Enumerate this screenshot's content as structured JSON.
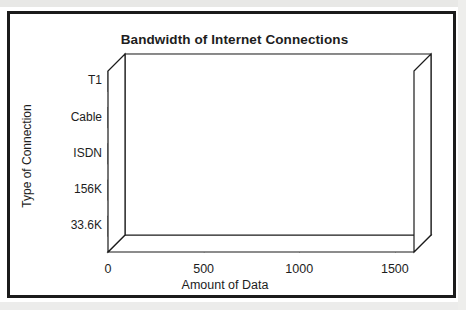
{
  "chart_data": {
    "type": "bar",
    "orientation": "horizontal",
    "style": "3d",
    "title": "Bandwidth of Internet Connections",
    "xlabel": "Amount of Data",
    "ylabel": "Type of Connection",
    "categories": [
      "T1",
      "Cable",
      "ISDN",
      "156K",
      "33.6K"
    ],
    "values": [
      1390,
      1045,
      640,
      255,
      145
    ],
    "xticks": [
      "0",
      "500",
      "1000",
      "1500"
    ],
    "xtickvalues": [
      0,
      500,
      1000,
      1500
    ],
    "xlim": [
      0,
      1600
    ],
    "grid": "vertical",
    "legend": "none",
    "series": [
      {
        "name": "Bandwidth",
        "values": [
          1390,
          1045,
          640,
          255,
          145
        ]
      }
    ],
    "colors": {
      "bar_front": "#a9a9a9",
      "bar_top": "#bdbdbd",
      "bar_side": "#8f8f8f",
      "bar_outline": "#555555",
      "axis": "#1b1b1b",
      "grid": "#1b1b1b",
      "frame": "#1b1b1b",
      "background": "#ffffff",
      "text": "#1d1d1d"
    }
  }
}
